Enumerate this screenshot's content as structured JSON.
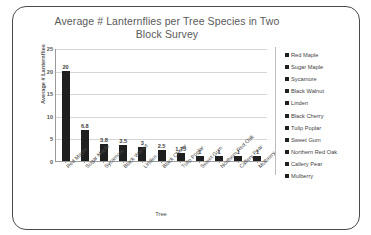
{
  "chart_data": {
    "type": "bar",
    "title": "Average # Lanternflies per Tree Species in Two Block Survey",
    "xlabel": "Tree",
    "ylabel": "Average # Lanternflies",
    "ylim": [
      0,
      25
    ],
    "yticks": [
      "25",
      "20",
      "15",
      "10",
      "5",
      "0"
    ],
    "ytick_values": [
      25,
      20,
      15,
      10,
      5,
      0
    ],
    "grid": true,
    "legend_position": "right",
    "categories": [
      "Red Maple",
      "Sugar Maple",
      "Sycamore",
      "Black Walnut",
      "Linden",
      "Black Cherry",
      "Tulip Poplar",
      "Sweet Gum",
      "Northern Red Oak",
      "Callery Pear",
      "Mulberry"
    ],
    "values": [
      20,
      6.8,
      3.8,
      3.5,
      3,
      2.5,
      1.75,
      1,
      1,
      1,
      1
    ],
    "data_labels": [
      "20",
      "6.8",
      "3.8",
      "3.5",
      "3",
      "2.5",
      "1.75",
      "1",
      "1",
      "1",
      "1"
    ],
    "legend": [
      "Red Maple",
      "Sugar Maple",
      "Sycamore",
      "Black Walnut",
      "Linden",
      "Black Cherry",
      "Tulip Poplar",
      "Sweet Gum",
      "Northern Red Oak",
      "Callery Pear",
      "Mulberry"
    ],
    "colors": {
      "bar": "#1f1f1f",
      "gridline": "#d6d6d6",
      "axis": "#9a9a9a",
      "title_text": "#5a5a5a",
      "label_text": "#3f3f3f",
      "card_border": "#4a4a4a",
      "background": "#ffffff"
    }
  }
}
